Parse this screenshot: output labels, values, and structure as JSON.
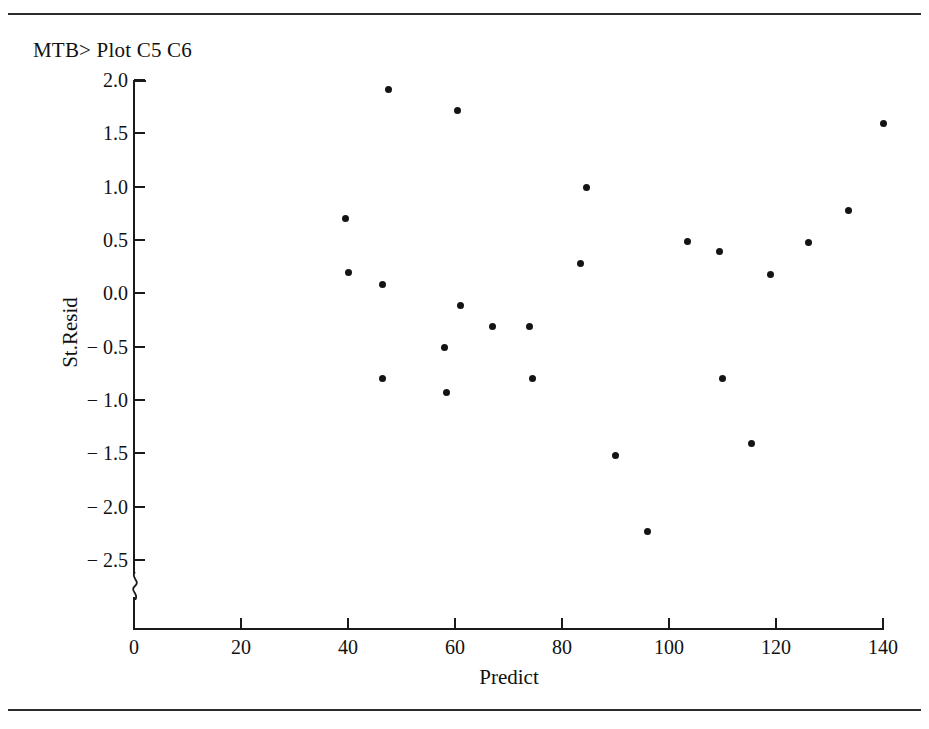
{
  "session": {
    "prompt_text": "MTB> Plot C5 C6"
  },
  "chart_data": {
    "type": "scatter",
    "title": "",
    "xlabel": "Predict",
    "ylabel": "St.Resid",
    "xlim": [
      0,
      140
    ],
    "ylim": [
      -2.5,
      2.0
    ],
    "xticks": [
      0,
      20,
      40,
      60,
      80,
      100,
      120,
      140
    ],
    "xtick_labels": [
      "0",
      "20",
      "40",
      "60",
      "80",
      "100",
      "120",
      "140"
    ],
    "yticks": [
      2.0,
      1.5,
      1.0,
      0.5,
      0.0,
      -0.5,
      -1.0,
      -1.5,
      -2.0,
      -2.5
    ],
    "ytick_labels": [
      "2.0",
      "1.5",
      "1.0",
      "0.5",
      "0.0",
      "− 0.5",
      "− 1.0",
      "− 1.5",
      "− 2.0",
      "− 2.5"
    ],
    "grid": false,
    "legend": false,
    "y_axis_break": true,
    "marker": {
      "shape": "circle",
      "color": "#141414",
      "size": 7
    },
    "points": [
      {
        "x": 39.5,
        "y": 0.7
      },
      {
        "x": 40.0,
        "y": 0.2
      },
      {
        "x": 46.5,
        "y": 0.08
      },
      {
        "x": 46.5,
        "y": -0.8
      },
      {
        "x": 47.5,
        "y": 1.91
      },
      {
        "x": 58.0,
        "y": -0.51
      },
      {
        "x": 58.5,
        "y": -0.93
      },
      {
        "x": 60.5,
        "y": 1.71
      },
      {
        "x": 61.0,
        "y": -0.11
      },
      {
        "x": 67.0,
        "y": -0.31
      },
      {
        "x": 74.0,
        "y": -0.31
      },
      {
        "x": 74.5,
        "y": -0.8
      },
      {
        "x": 83.5,
        "y": 0.28
      },
      {
        "x": 84.5,
        "y": 0.99
      },
      {
        "x": 90.0,
        "y": -1.52
      },
      {
        "x": 96.0,
        "y": -2.23
      },
      {
        "x": 103.5,
        "y": 0.49
      },
      {
        "x": 109.5,
        "y": 0.39
      },
      {
        "x": 110.0,
        "y": -0.8
      },
      {
        "x": 115.5,
        "y": -1.41
      },
      {
        "x": 119.0,
        "y": 0.18
      },
      {
        "x": 126.0,
        "y": 0.48
      },
      {
        "x": 133.5,
        "y": 0.78
      },
      {
        "x": 140.0,
        "y": 1.59
      }
    ]
  }
}
